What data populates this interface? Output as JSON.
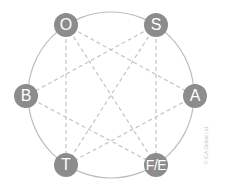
{
  "diagram": {
    "colors": {
      "node_fill": "#8c8c8c",
      "node_text": "#ffffff",
      "ring": "#bdbdbd",
      "dashes": "#c4c4c4"
    },
    "nodes": [
      {
        "id": "O",
        "label": "O",
        "x": 66,
        "y": 25
      },
      {
        "id": "S",
        "label": "S",
        "x": 156,
        "y": 25
      },
      {
        "id": "B",
        "label": "B",
        "x": 26,
        "y": 96
      },
      {
        "id": "A",
        "label": "A",
        "x": 195,
        "y": 96
      },
      {
        "id": "T",
        "label": "T",
        "x": 66,
        "y": 165
      },
      {
        "id": "FE",
        "label": "F/E",
        "x": 156,
        "y": 165
      }
    ],
    "connections": [
      [
        "O",
        "T"
      ],
      [
        "O",
        "FE"
      ],
      [
        "O",
        "A"
      ],
      [
        "S",
        "FE"
      ],
      [
        "S",
        "T"
      ],
      [
        "S",
        "B"
      ],
      [
        "B",
        "FE"
      ],
      [
        "A",
        "T"
      ]
    ],
    "copyright": "© ICA Global Ltd."
  }
}
